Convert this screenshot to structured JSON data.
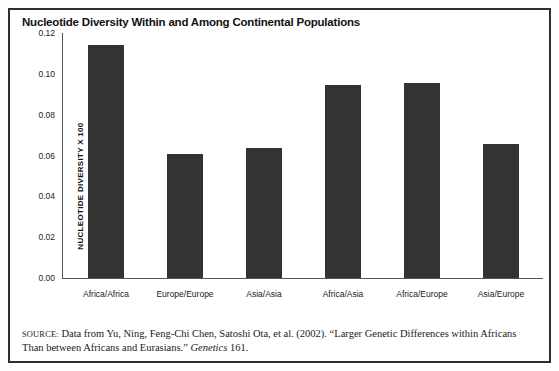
{
  "figure": {
    "title": "Nucleotide Diversity Within and Among Continental Populations",
    "source_prefix": "SOURCE:",
    "source_text_1": " Data from Yu, Ning, Feng-Chi Chen, Satoshi Ota, et al. (2002). “Larger Genetic Differences within Africans Than between Africans and Eurasians.” ",
    "source_journal": "Genetics",
    "source_text_2": " 161."
  },
  "chart_data": {
    "type": "bar",
    "title": "Nucleotide Diversity Within and Among Continental Populations",
    "xlabel": "",
    "ylabel": "NUCLEOTIDE DIVERSITY X 100",
    "categories": [
      "Africa/Africa",
      "Europe/Europe",
      "Asia/Asia",
      "Africa/Asia",
      "Africa/Europe",
      "Asia/Europe"
    ],
    "values": [
      0.114,
      0.0605,
      0.0635,
      0.0945,
      0.0955,
      0.0655
    ],
    "ylim": [
      0.0,
      0.12
    ],
    "yticks": [
      0.0,
      0.02,
      0.04,
      0.06,
      0.08,
      0.1,
      0.12
    ],
    "ytick_labels": [
      "0.00",
      "0.02",
      "0.04",
      "0.06",
      "0.08",
      "0.10",
      "0.12"
    ],
    "grid": false,
    "legend": false,
    "bar_color": "#333333",
    "axis_color": "#555555"
  }
}
